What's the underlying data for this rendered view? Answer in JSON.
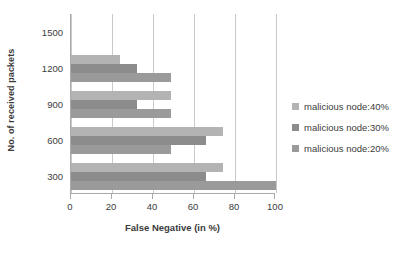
{
  "chart_data": {
    "type": "bar",
    "orientation": "horizontal",
    "title": "",
    "xlabel": "False Negative (in %)",
    "ylabel": "No. of received packets",
    "categories": [
      "300",
      "600",
      "900",
      "1200",
      "1500"
    ],
    "xlim": [
      0,
      100
    ],
    "xticks": [
      0,
      20,
      40,
      60,
      80,
      100
    ],
    "yticks": [
      "300",
      "600",
      "900",
      "1200",
      "1500"
    ],
    "grid": "vertical",
    "legend_position": "right",
    "series": [
      {
        "name": "malicious node:40%",
        "color": "#b3b3b3",
        "values": [
          74,
          74,
          49,
          24,
          0
        ]
      },
      {
        "name": "malicious node:30%",
        "color": "#8c8c8c",
        "values": [
          66,
          66,
          32,
          32,
          0
        ]
      },
      {
        "name": "malicious node:20%",
        "color": "#9a9a9a",
        "values": [
          100,
          49,
          49,
          49,
          0
        ]
      }
    ]
  },
  "axes": {
    "y_title": "No. of received packets",
    "x_title": "False Negative (in %)",
    "y_tick_labels": [
      "1500",
      "1200",
      "900",
      "600",
      "300"
    ],
    "x_tick_labels": [
      "0",
      "20",
      "40",
      "60",
      "80",
      "100"
    ]
  },
  "legend": {
    "items": [
      {
        "label": "malicious node:40%",
        "color": "#b3b3b3"
      },
      {
        "label": "malicious node:30%",
        "color": "#8c8c8c"
      },
      {
        "label": "malicious node:20%",
        "color": "#9a9a9a"
      }
    ]
  },
  "style": {
    "grid_color": "#c9c9c9",
    "axis_color": "#aaaaaa",
    "text_color": "#3b3b3b",
    "background": "#ffffff"
  }
}
